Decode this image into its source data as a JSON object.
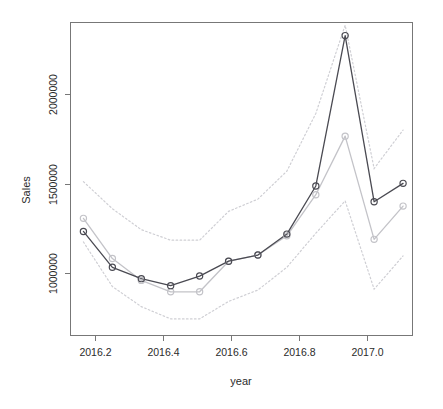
{
  "chart_data": {
    "type": "line",
    "title": "",
    "xlabel": "year",
    "ylabel": "Sales",
    "xlim": [
      2016.13,
      2017.11
    ],
    "ylim": [
      620000,
      2410000
    ],
    "xticks": [
      2016.2,
      2016.4,
      2016.6,
      2016.8,
      2017.0
    ],
    "xtick_labels": [
      "2016.2",
      "2016.4",
      "2016.6",
      "2016.8",
      "2017.0"
    ],
    "yticks": [
      1000000,
      1500000,
      2000000
    ],
    "ytick_labels": [
      "1000000",
      "1500000",
      "2000000"
    ],
    "grid": false,
    "legend": "none",
    "x": [
      2016.167,
      2016.25,
      2016.333,
      2016.417,
      2016.5,
      2016.583,
      2016.667,
      2016.75,
      2016.833,
      2016.917,
      2017.0,
      2017.083
    ],
    "series": [
      {
        "name": "actual",
        "style": "solid-dark-circles",
        "color": "#4a4a52",
        "values": [
          1215000,
          1010000,
          945000,
          905000,
          960000,
          1045000,
          1080000,
          1200000,
          1475000,
          2335000,
          1385000,
          1490000
        ]
      },
      {
        "name": "fitted",
        "style": "solid-gray-circles",
        "color": "#c3c3c8",
        "values": [
          1290000,
          1060000,
          935000,
          870000,
          870000,
          1045000,
          1080000,
          1190000,
          1425000,
          1760000,
          1170000,
          1360000
        ]
      },
      {
        "name": "upper-bound",
        "style": "dotted-gray",
        "color": "#cfcfd4",
        "values": [
          1500000,
          1345000,
          1225000,
          1165000,
          1165000,
          1330000,
          1400000,
          1560000,
          1890000,
          2395000,
          1575000,
          1795000
        ]
      },
      {
        "name": "lower-bound",
        "style": "dotted-gray",
        "color": "#cfcfd4",
        "values": [
          1155000,
          900000,
          785000,
          715000,
          715000,
          815000,
          880000,
          1010000,
          1205000,
          1390000,
          885000,
          1075000
        ]
      }
    ]
  },
  "axes": {
    "y_title": "Sales",
    "x_title": "year",
    "y_tick_labels": [
      "1000000",
      "1500000",
      "2000000"
    ],
    "x_tick_labels": [
      "2016.2",
      "2016.4",
      "2016.6",
      "2016.8",
      "2017.0"
    ]
  },
  "colors": {
    "actual": "#4a4a52",
    "fitted": "#c3c3c8",
    "band": "#cfcfd4",
    "frame": "#777777",
    "text": "#2b2b2b",
    "background": "#ffffff"
  }
}
